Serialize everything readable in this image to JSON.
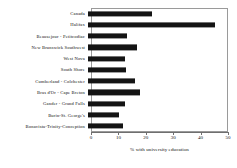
{
  "chart": {
    "axis_title": "% with university education",
    "tick_labels": [
      "0",
      "10",
      "20",
      "30",
      "40",
      "50"
    ],
    "bar_color": "#141414",
    "frame_color": "#9a9a9a"
  },
  "chart_data": {
    "type": "bar",
    "orientation": "horizontal",
    "title": "",
    "subtitle": "",
    "xlabel": "% with university education",
    "ylabel": "",
    "xlim": [
      0,
      50
    ],
    "xticks": [
      0,
      10,
      20,
      30,
      40,
      50
    ],
    "grid": false,
    "legend": false,
    "categories": [
      "Canada",
      "Halifax",
      "Beausejour - Petitcodiac",
      "New Brunswick Southwest",
      "West Nova",
      "South Shore",
      "Cumberland - Colchester",
      "Bras d'Or - Cape Breton",
      "Gander - Grand Falls",
      "Burin-St. George's",
      "Bonavista-Trinity-Conception"
    ],
    "values": [
      23.3,
      46.5,
      14.2,
      17.8,
      13.6,
      14.0,
      17.0,
      18.8,
      13.4,
      11.2,
      12.6
    ],
    "series": [
      {
        "name": "% with university education",
        "values": [
          23.3,
          46.5,
          14.2,
          17.8,
          13.6,
          14.0,
          17.0,
          18.8,
          13.4,
          11.2,
          12.6
        ]
      }
    ]
  }
}
